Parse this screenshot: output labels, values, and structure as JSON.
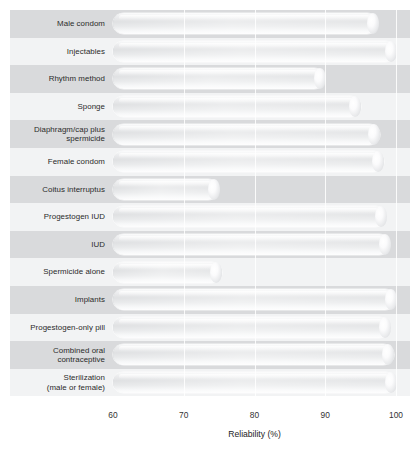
{
  "chart_data": {
    "type": "bar",
    "orientation": "horizontal",
    "title": "",
    "xlabel": "Reliability (%)",
    "ylabel": "",
    "xlim": [
      60,
      100
    ],
    "xticks": [
      60,
      70,
      80,
      90,
      100
    ],
    "xtick_labels": [
      "60",
      "70",
      "80",
      "90",
      "100"
    ],
    "grid": true,
    "grid_axis": "x",
    "legend": "none",
    "bar_style": "3d-cylinder-gradient",
    "row_banding": [
      "shade",
      "light",
      "shade",
      "light",
      "shade",
      "light",
      "shade",
      "light",
      "shade",
      "light",
      "shade",
      "light",
      "shade",
      "light"
    ],
    "categories": [
      "Male condom",
      "Injectables",
      "Rhythm method",
      "Sponge",
      "Diaphragm/cap plus spermicide",
      "Female condom",
      "Coitus interruptus",
      "Progestogen IUD",
      "IUD",
      "Spermicide alone",
      "Implants",
      "Progestogen-only pill",
      "Combined oral contraceptive",
      "Sterilization (male or female)"
    ],
    "category_lines": [
      [
        "Male condom"
      ],
      [
        "Injectables"
      ],
      [
        "Rhythm method"
      ],
      [
        "Sponge"
      ],
      [
        "Diaphragm/cap plus",
        "spermicide"
      ],
      [
        "Female condom"
      ],
      [
        "Coitus interruptus"
      ],
      [
        "Progestogen IUD"
      ],
      [
        "IUD"
      ],
      [
        "Spermicide alone"
      ],
      [
        "Implants"
      ],
      [
        "Progestogen-only pill"
      ],
      [
        "Combined oral",
        "contraceptive"
      ],
      [
        "Sterilization",
        "(male or female)"
      ]
    ],
    "values": [
      97.5,
      100,
      90,
      95,
      97.7,
      98.3,
      75,
      98.6,
      99.2,
      75.4,
      100,
      99.2,
      99.7,
      100
    ]
  },
  "colors": {
    "band_shade": "#d9dadc",
    "band_light": "#f2f3f4",
    "bar_mid": "#b9bcc0",
    "bar_edge": "#f7f8f9",
    "text": "#2a2a2a",
    "background": "#ffffff"
  },
  "axis_labels": {
    "t0": "60",
    "t1": "70",
    "t2": "80",
    "t3": "90",
    "t4": "100",
    "title": "Reliability (%)"
  }
}
